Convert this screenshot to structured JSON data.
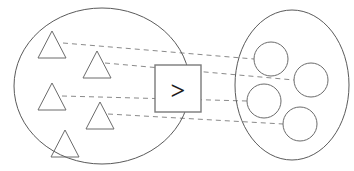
{
  "diagram": {
    "type": "set-comparison",
    "title": "",
    "background_color": "#ffffff",
    "outline_color": "#5a5a5a",
    "shape_color": "#6b6b6b",
    "line_color": "#8a8a8a",
    "symbol_color": "#1d1d1d",
    "left_set": {
      "label": "",
      "shape_kind": "triangle",
      "count": 5,
      "ellipse": {
        "cx": 102,
        "cy": 86,
        "rx": 88,
        "ry": 78
      },
      "items": [
        {
          "name": "triangle-1",
          "cx": 52,
          "cy": 46,
          "size": 23
        },
        {
          "name": "triangle-2",
          "cx": 97,
          "cy": 66,
          "size": 23
        },
        {
          "name": "triangle-3",
          "cx": 52,
          "cy": 98,
          "size": 23
        },
        {
          "name": "triangle-4",
          "cx": 100,
          "cy": 117,
          "size": 23
        },
        {
          "name": "triangle-5",
          "cx": 65,
          "cy": 145,
          "size": 23
        }
      ]
    },
    "right_set": {
      "label": "",
      "shape_kind": "circle",
      "count": 4,
      "ellipse": {
        "cx": 292,
        "cy": 85,
        "rx": 57,
        "ry": 75
      },
      "items": [
        {
          "name": "circle-1",
          "cx": 271,
          "cy": 59,
          "r": 17
        },
        {
          "name": "circle-2",
          "cx": 311,
          "cy": 80,
          "r": 17
        },
        {
          "name": "circle-3",
          "cx": 264,
          "cy": 101,
          "r": 17
        },
        {
          "name": "circle-4",
          "cx": 300,
          "cy": 124,
          "r": 17
        }
      ]
    },
    "operator": {
      "symbol": ">",
      "meaning": "greater-than",
      "box": {
        "x": 155,
        "y": 65,
        "w": 46,
        "h": 47
      }
    },
    "connections": [
      {
        "name": "match-line-1",
        "from": "triangle-1",
        "to": "circle-1",
        "x1": 63,
        "y1": 43,
        "x2": 254,
        "y2": 59
      },
      {
        "name": "match-line-2",
        "from": "triangle-2",
        "to": "circle-2",
        "x1": 105,
        "y1": 63,
        "x2": 294,
        "y2": 80
      },
      {
        "name": "match-line-3",
        "from": "triangle-3",
        "to": "circle-3",
        "x1": 62,
        "y1": 96,
        "x2": 247,
        "y2": 101
      },
      {
        "name": "match-line-4",
        "from": "triangle-4",
        "to": "circle-4",
        "x1": 108,
        "y1": 114,
        "x2": 283,
        "y2": 124
      }
    ]
  }
}
